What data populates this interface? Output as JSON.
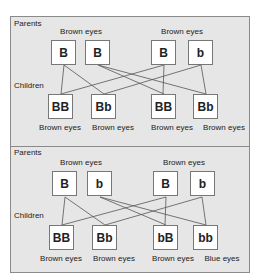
{
  "panels": [
    {
      "parents_label": "Parents",
      "children_label": "Children",
      "parent_groups": [
        {
          "label": "Brown eyes",
          "alleles": [
            "B",
            "B"
          ]
        },
        {
          "label": "Brown eyes",
          "alleles": [
            "B",
            "b"
          ]
        }
      ],
      "children": [
        {
          "genotype": "BB",
          "phenotype": "Brown eyes"
        },
        {
          "genotype": "Bb",
          "phenotype": "Brown eyes"
        },
        {
          "genotype": "BB",
          "phenotype": "Brown eyes"
        },
        {
          "genotype": "Bb",
          "phenotype": "Brown eyes"
        }
      ]
    },
    {
      "parents_label": "Parents",
      "children_label": "Children",
      "parent_groups": [
        {
          "label": "Brown eyes",
          "alleles": [
            "B",
            "b"
          ]
        },
        {
          "label": "Brown eyes",
          "alleles": [
            "B",
            "b"
          ]
        }
      ],
      "children": [
        {
          "genotype": "BB",
          "phenotype": "Brown eyes"
        },
        {
          "genotype": "Bb",
          "phenotype": "Brown eyes"
        },
        {
          "genotype": "bB",
          "phenotype": "Brown eyes"
        },
        {
          "genotype": "bb",
          "phenotype": "Blue eyes"
        }
      ]
    }
  ],
  "colors": {
    "background": "#e6e6e6",
    "box_fill": "#ffffff",
    "box_border": "#777777",
    "line": "#555555",
    "text": "#222222"
  }
}
